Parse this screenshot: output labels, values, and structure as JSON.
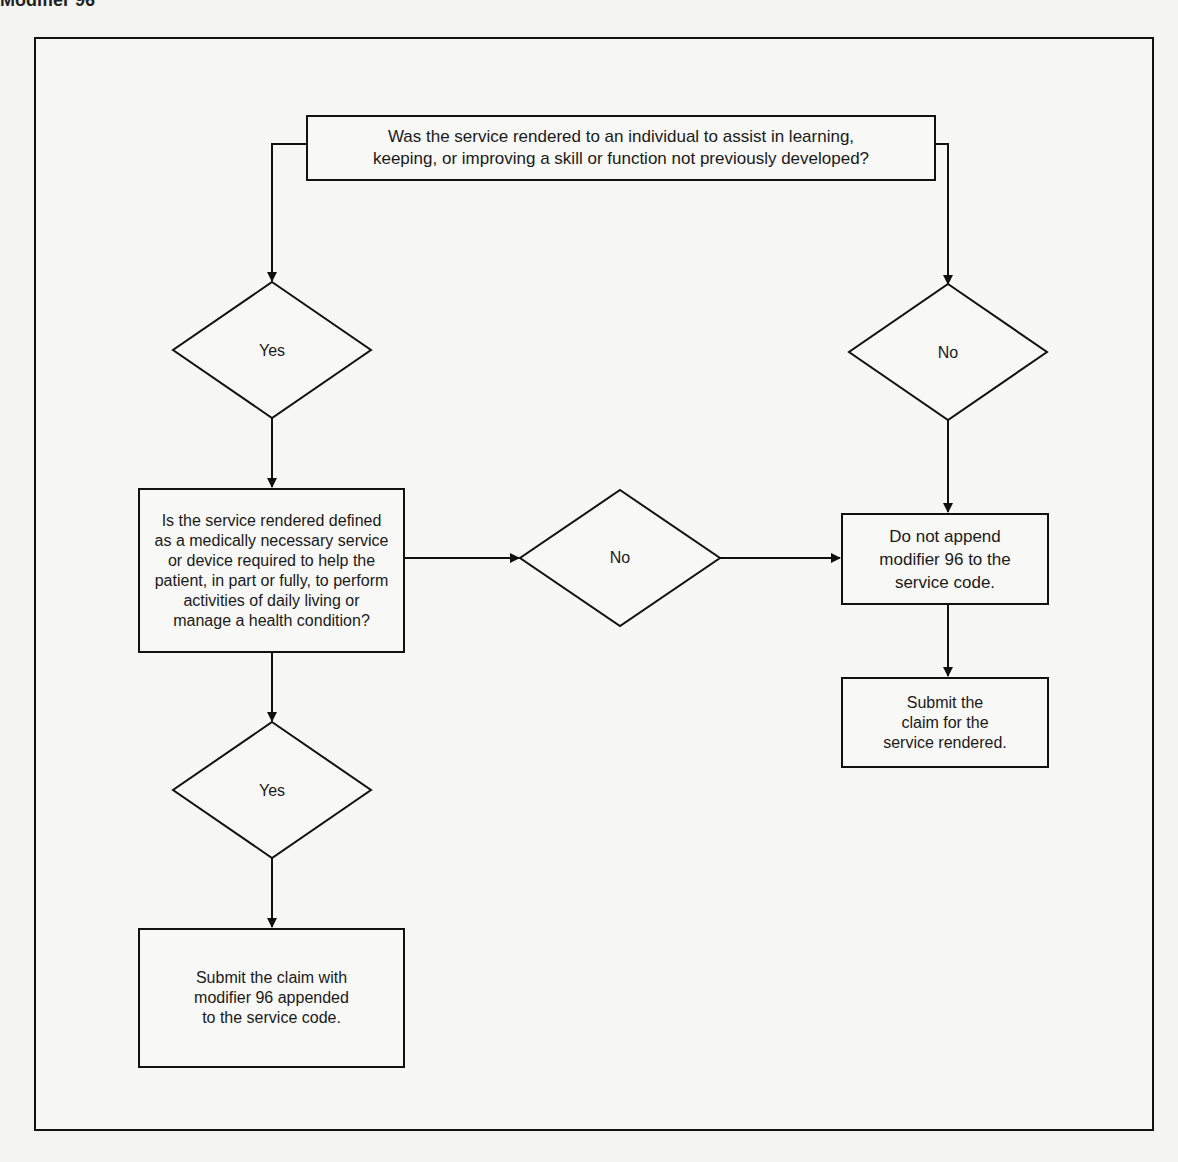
{
  "header": {
    "fragment": "Modifier 96"
  },
  "flowchart": {
    "start_question": "Was the service rendered to an individual to assist in learning,\nkeeping, or improving a skill or function not previously developed?",
    "branch_left_label": "Yes",
    "branch_right_label": "No",
    "second_question": "Is the service rendered defined\nas a medically necessary service\nor device required to help the\npatient, in part or fully, to perform\nactivities of daily living or\nmanage a health condition?",
    "second_no_label": "No",
    "second_yes_label": "Yes",
    "do_not_append": "Do not append\nmodifier 96 to the\nservice code.",
    "submit_claim_plain": "Submit the\nclaim for the\nservice rendered.",
    "submit_claim_modifier": "Submit the claim with\nmodifier 96 appended\nto the service code."
  },
  "colors": {
    "line": "#111111",
    "background": "#f4f4f2"
  }
}
